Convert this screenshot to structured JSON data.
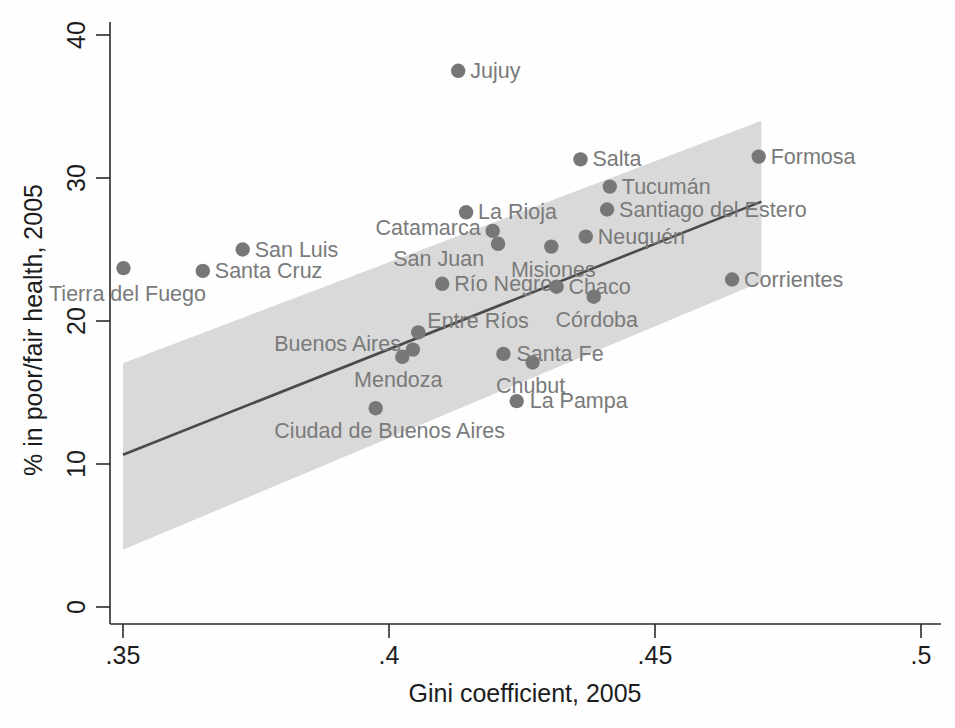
{
  "chart_data": {
    "type": "scatter",
    "title": "",
    "xlabel": "Gini coefficient, 2005",
    "ylabel": "% in poor/fair health, 2005",
    "xlim": [
      0.35,
      0.5
    ],
    "ylim": [
      0,
      41.5
    ],
    "xticks": [
      ".35",
      ".4",
      ".45",
      ".5"
    ],
    "xtick_values": [
      0.35,
      0.4,
      0.45,
      0.5
    ],
    "yticks": [
      "0",
      "10",
      "20",
      "30",
      "40"
    ],
    "ytick_values": [
      0,
      10,
      20,
      30,
      40
    ],
    "grid": false,
    "legend": "none",
    "marker_color": "#777777",
    "band_color": "#d9d9d9",
    "line_color": "#4a4a4a",
    "label_color": "#7a7a7a",
    "points": [
      {
        "name": "Jujuy",
        "x": 0.413,
        "y": 37.5,
        "label_dx": 12,
        "label_dy": 7,
        "anchor": "start"
      },
      {
        "name": "Salta",
        "x": 0.436,
        "y": 31.3,
        "label_dx": 12,
        "label_dy": 7,
        "anchor": "start"
      },
      {
        "name": "Formosa",
        "x": 0.4695,
        "y": 31.5,
        "label_dx": 12,
        "label_dy": 7,
        "anchor": "start"
      },
      {
        "name": "Tucumán",
        "x": 0.4415,
        "y": 29.4,
        "label_dx": 12,
        "label_dy": 7,
        "anchor": "start"
      },
      {
        "name": "Santiago del Estero",
        "x": 0.441,
        "y": 27.8,
        "label_dx": 12,
        "label_dy": 7,
        "anchor": "start"
      },
      {
        "name": "La Rioja",
        "x": 0.4145,
        "y": 27.6,
        "label_dx": 12,
        "label_dy": 7,
        "anchor": "start"
      },
      {
        "name": "Catamarca",
        "x": 0.4195,
        "y": 26.3,
        "label_dx": -12,
        "label_dy": 4,
        "anchor": "end"
      },
      {
        "name": "Neuquén",
        "x": 0.437,
        "y": 25.9,
        "label_dx": 12,
        "label_dy": 7,
        "anchor": "start"
      },
      {
        "name": "San Luis",
        "x": 0.3725,
        "y": 25.0,
        "label_dx": 12,
        "label_dy": 7,
        "anchor": "start"
      },
      {
        "name": "San Juan",
        "x": 0.4205,
        "y": 25.4,
        "label_dx": -14,
        "label_dy": 22,
        "anchor": "end"
      },
      {
        "name": "Misiones",
        "x": 0.4305,
        "y": 25.2,
        "label_dx": 2,
        "label_dy": 30,
        "anchor": "middle"
      },
      {
        "name": "Tierra del Fuego",
        "x": 0.3501,
        "y": 23.7,
        "label_dx": 4,
        "label_dy": 33,
        "anchor": "middle"
      },
      {
        "name": "Santa Cruz",
        "x": 0.365,
        "y": 23.5,
        "label_dx": 12,
        "label_dy": 7,
        "anchor": "start"
      },
      {
        "name": "Corrientes",
        "x": 0.4645,
        "y": 22.9,
        "label_dx": 12,
        "label_dy": 7,
        "anchor": "start"
      },
      {
        "name": "Río Negro",
        "x": 0.41,
        "y": 22.6,
        "label_dx": 12,
        "label_dy": 7,
        "anchor": "start"
      },
      {
        "name": "Chaco",
        "x": 0.4315,
        "y": 22.4,
        "label_dx": 12,
        "label_dy": 7,
        "anchor": "start"
      },
      {
        "name": "Córdoba",
        "x": 0.4385,
        "y": 21.7,
        "label_dx": 3,
        "label_dy": 30,
        "anchor": "middle"
      },
      {
        "name": "Entre Ríos",
        "x": 0.4055,
        "y": 19.2,
        "label_dx": 9,
        "label_dy": -4,
        "anchor": "start"
      },
      {
        "name": "Buenos Aires",
        "x": 0.4045,
        "y": 18.0,
        "label_dx": -12,
        "label_dy": 1,
        "anchor": "end"
      },
      {
        "name": "Mendoza",
        "x": 0.4025,
        "y": 17.5,
        "label_dx": -4,
        "label_dy": 30,
        "anchor": "middle"
      },
      {
        "name": "Santa Fe",
        "x": 0.4215,
        "y": 17.7,
        "label_dx": 13,
        "label_dy": 7,
        "anchor": "start"
      },
      {
        "name": "Chubut",
        "x": 0.427,
        "y": 17.1,
        "label_dx": -2,
        "label_dy": 30,
        "anchor": "middle"
      },
      {
        "name": "La Pampa",
        "x": 0.424,
        "y": 14.4,
        "label_dx": 13,
        "label_dy": 7,
        "anchor": "start"
      },
      {
        "name": "Ciudad de Buenos Aires",
        "x": 0.3975,
        "y": 13.9,
        "label_dx": 14,
        "label_dy": 30,
        "anchor": "middle"
      }
    ],
    "fit_line": {
      "x0": 0.35,
      "y0": 10.65,
      "x1": 0.47,
      "y1": 28.35
    },
    "ci_band": {
      "x0": 0.35,
      "x1": 0.47,
      "upper_y0": 17.05,
      "upper_y1": 34.0,
      "lower_y0": 4.0,
      "lower_y1": 22.75
    }
  }
}
